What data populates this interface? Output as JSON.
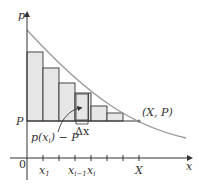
{
  "figure": {
    "y_axis_label": "p",
    "x_axis_label": "x",
    "origin_label": "0",
    "p_level_label": "P",
    "point_label": "(X, P)",
    "x_ticks": [
      {
        "label": "x",
        "sub": "1"
      },
      {
        "label": "x",
        "sub": "i−1"
      },
      {
        "label": "x",
        "sub": "i"
      },
      {
        "label": "X",
        "sub": ""
      }
    ],
    "annotation_height": "p(x",
    "annotation_height_sub": "i",
    "annotation_height_tail": ") − P",
    "annotation_width": "Δx",
    "colors": {
      "curve": "#9a9a9a",
      "rect_fill": "#e6e6e6",
      "rect_stroke": "#333333",
      "axis": "#333333"
    }
  }
}
